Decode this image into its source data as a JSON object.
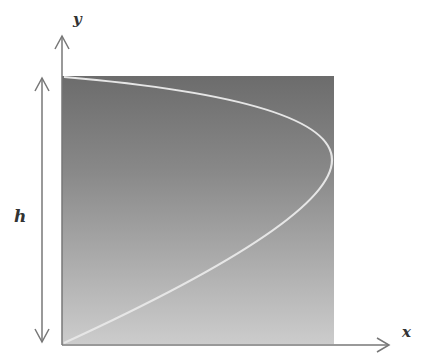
{
  "diagram": {
    "labels": {
      "y_axis": "y",
      "x_axis": "x",
      "height": "h"
    },
    "colors": {
      "gradient_top": "#6e6e6e",
      "gradient_bottom": "#cacaca",
      "curve": "#e8e8e8",
      "axis": "#777777",
      "background": "#ffffff"
    },
    "region": {
      "x0": 62,
      "y0": 76,
      "x1": 334,
      "y1": 344
    },
    "curve_shape": "parabola opening left, vertex at right edge near y=158 (upper third)"
  }
}
